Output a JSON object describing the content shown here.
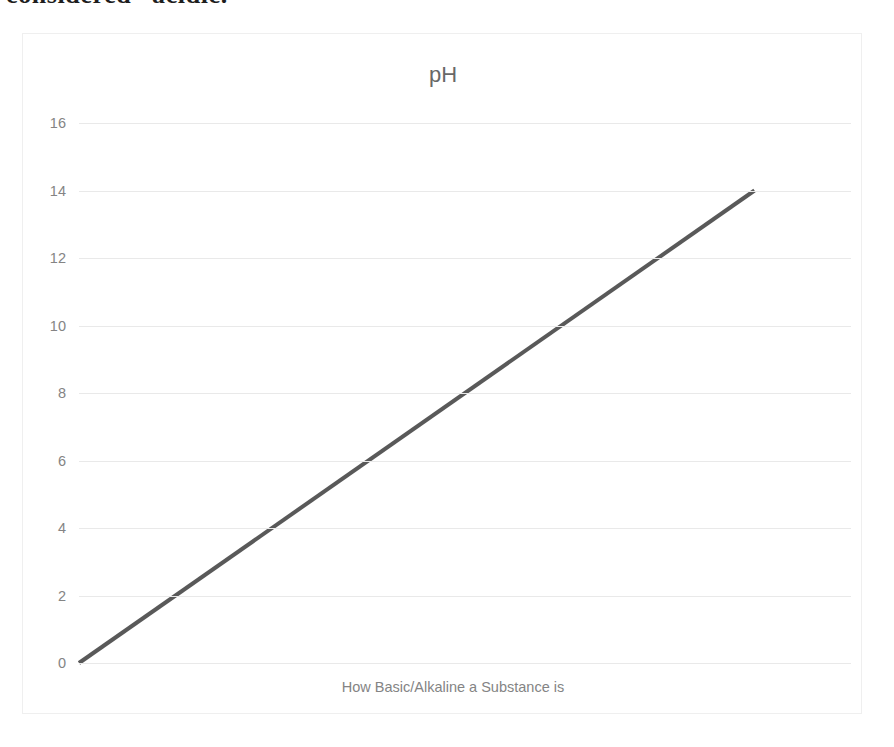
{
  "document": {
    "clipped_text_line": "considered “acidic.”"
  },
  "figure": {
    "title": "pH",
    "xaxis_title": "How Basic/Alkaline a Substance is",
    "title_color": "#686868",
    "axis_text_color": "#848484",
    "gridline_color": "#e9e9e9",
    "series_color": "#595959",
    "frame_border_color": "#efefef",
    "background_color": "#ffffff"
  },
  "chart_data": {
    "type": "line",
    "title": "pH",
    "xlabel": "How Basic/Alkaline a Substance is",
    "ylabel": "",
    "ylim": [
      0,
      16
    ],
    "yticks": [
      0,
      2,
      4,
      6,
      8,
      10,
      12,
      14,
      16
    ],
    "ytick_labels": [
      "0",
      "2",
      "4",
      "6",
      "8",
      "10",
      "12",
      "14",
      "16"
    ],
    "xlim": [
      0,
      16
    ],
    "xticks": [],
    "xtick_labels": [],
    "grid": "horizontal",
    "legend": "none",
    "series": [
      {
        "name": "pH",
        "color": "#595959",
        "line_width": 4,
        "x": [
          0,
          14
        ],
        "y": [
          0,
          14
        ],
        "points": [
          {
            "x": 0,
            "y": 0
          },
          {
            "x": 14,
            "y": 14
          }
        ]
      }
    ]
  }
}
